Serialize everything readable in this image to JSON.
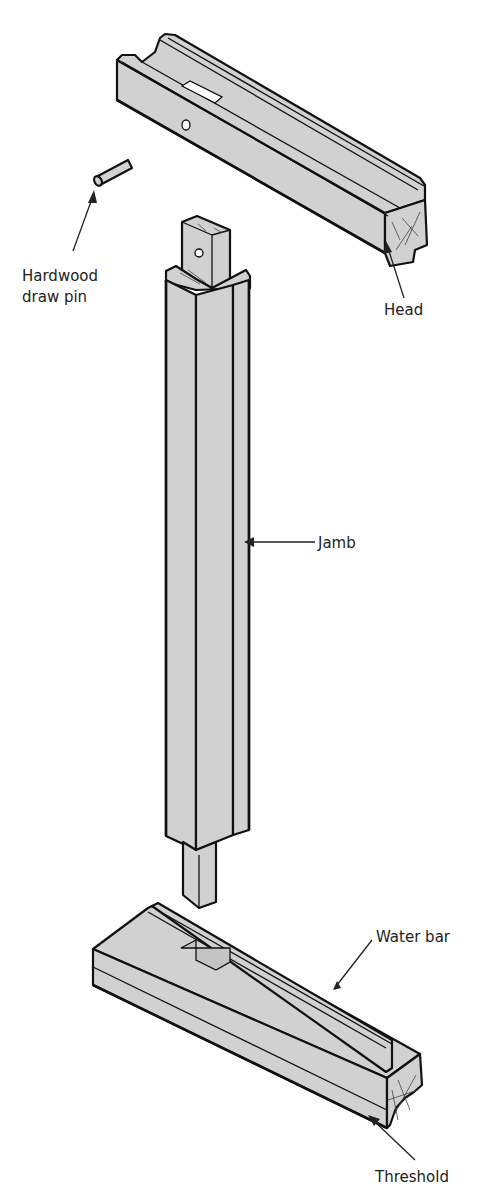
{
  "figure": {
    "colors": {
      "wood_fill": "#d1d1d1",
      "outline": "#111111",
      "label_text": "#222222",
      "background": "#ffffff"
    },
    "parts": [
      {
        "id": "head",
        "label": "Head"
      },
      {
        "id": "draw_pin",
        "label_line1": "Hardwood",
        "label_line2": "draw pin"
      },
      {
        "id": "jamb",
        "label": "Jamb"
      },
      {
        "id": "water_bar",
        "label": "Water bar"
      },
      {
        "id": "threshold",
        "label": "Threshold"
      }
    ]
  }
}
